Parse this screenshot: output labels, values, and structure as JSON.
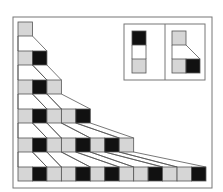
{
  "diagram": {
    "title": "",
    "type": "substitution-system",
    "colors": {
      "gray": "#d6d6d6",
      "black": "#111111",
      "stroke": "#555555",
      "frame": "#777777",
      "background": "#ffffff"
    },
    "rules": [
      {
        "from": [
          "B"
        ],
        "to": [
          "G"
        ]
      },
      {
        "from": [
          "G"
        ],
        "to": [
          "G",
          "B"
        ]
      }
    ],
    "rows": [
      [
        "G"
      ],
      [
        "G",
        "B"
      ],
      [
        "G",
        "B",
        "G"
      ],
      [
        "G",
        "B",
        "G",
        "G",
        "B"
      ],
      [
        "G",
        "B",
        "G",
        "G",
        "B",
        "G",
        "B",
        "G"
      ],
      [
        "G",
        "B",
        "G",
        "G",
        "B",
        "G",
        "B",
        "G",
        "G",
        "B",
        "G",
        "G",
        "B"
      ]
    ]
  }
}
